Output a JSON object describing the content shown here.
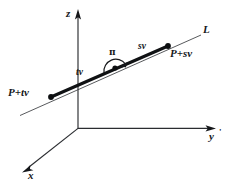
{
  "figure": {
    "background_color": "#ffffff",
    "ink_color": "#15171a",
    "width": 236,
    "height": 192,
    "axes": {
      "origin": {
        "x": 78,
        "y": 128
      },
      "items": [
        {
          "name": "z",
          "label": "z",
          "from": {
            "x": 78,
            "y": 128
          },
          "to": {
            "x": 78,
            "y": 11
          },
          "arrow": true
        },
        {
          "name": "y",
          "label": "y",
          "from": {
            "x": 78,
            "y": 128
          },
          "to": {
            "x": 215,
            "y": 128
          },
          "arrow": true
        },
        {
          "name": "x",
          "label": "x",
          "from": {
            "x": 78,
            "y": 128
          },
          "to": {
            "x": 23,
            "y": 172
          },
          "arrow": true
        }
      ],
      "y_prime_mark": "'"
    },
    "line": {
      "name": "L",
      "label": "L",
      "thin_from": {
        "x": 20,
        "y": 115
      },
      "thin_to": {
        "x": 201,
        "y": 35
      },
      "thick_from": {
        "x": 51,
        "y": 97
      },
      "thick_to": {
        "x": 168,
        "y": 46
      }
    },
    "points": [
      {
        "name": "P-plus-tv",
        "label": "P+tv",
        "x": 51,
        "y": 97
      },
      {
        "name": "P",
        "label": "",
        "x": 115,
        "y": 68
      },
      {
        "name": "P-plus-sv",
        "label": "P+sv",
        "x": 168,
        "y": 46
      }
    ],
    "segment_labels": [
      {
        "name": "tv",
        "label": "tv"
      },
      {
        "name": "sv",
        "label": "sv"
      }
    ],
    "angle": {
      "name": "pi-angle",
      "label": "π",
      "center": {
        "x": 115,
        "y": 68
      },
      "radius": 12
    }
  }
}
